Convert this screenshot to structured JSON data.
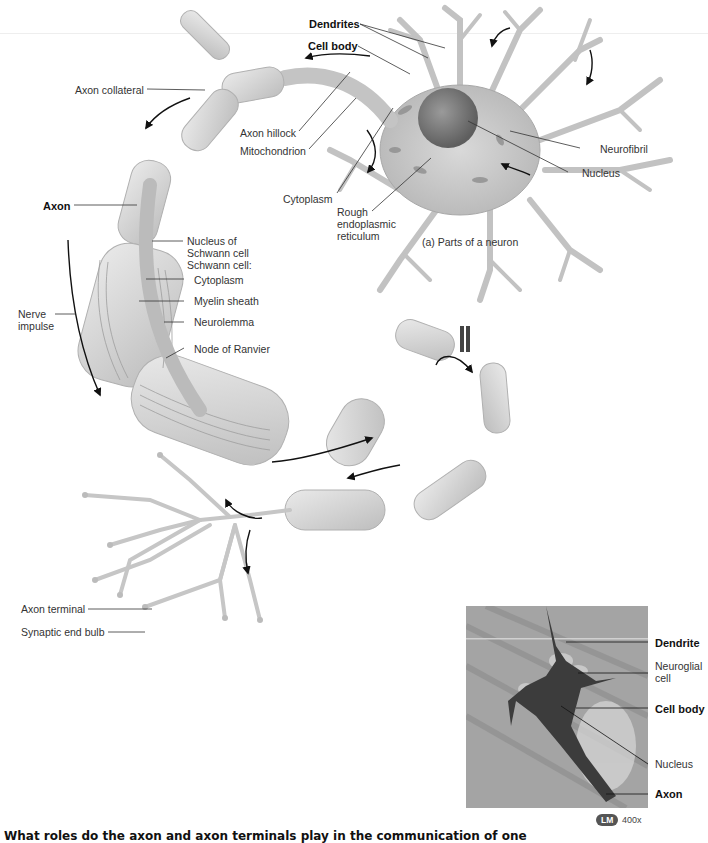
{
  "figure": {
    "caption": "(a) Parts of a neuron",
    "labels": {
      "dendrites": "Dendrites",
      "cell_body": "Cell body",
      "axon_collateral": "Axon collateral",
      "axon_hillock": "Axon hillock",
      "mitochondrion": "Mitochondrion",
      "cytoplasm": "Cytoplasm",
      "rough_er": "Rough endoplasmic reticulum",
      "neurofibril": "Neurofibril",
      "nucleus": "Nucleus",
      "axon": "Axon",
      "nucleus_of_schwann_cell": "Nucleus of Schwann cell",
      "schwann_cell_header": "Schwann cell:",
      "schwann_cytoplasm": "Cytoplasm",
      "myelin_sheath": "Myelin sheath",
      "neurolemma": "Neurolemma",
      "nerve_impulse": "Nerve impulse",
      "node_of_ranvier": "Node of Ranvier",
      "axon_terminal": "Axon terminal",
      "synaptic_end_bulb": "Synaptic end bulb"
    }
  },
  "micrograph": {
    "labels": {
      "dendrite": "Dendrite",
      "neuroglial_cell": "Neuroglial cell",
      "cell_body": "Cell body",
      "nucleus": "Nucleus",
      "axon": "Axon"
    },
    "badge": "LM",
    "magnification": "400x"
  },
  "question": {
    "text": "What roles do the axon and axon terminals play in the communication of one"
  },
  "colors": {
    "tissue": "#c8c8c8",
    "tissue_dark": "#9c9c9c",
    "leader_line": "#333333",
    "arrow": "#111111",
    "micro_bg": "#a0a0a0",
    "micro_cell": "#3a3a3a"
  }
}
